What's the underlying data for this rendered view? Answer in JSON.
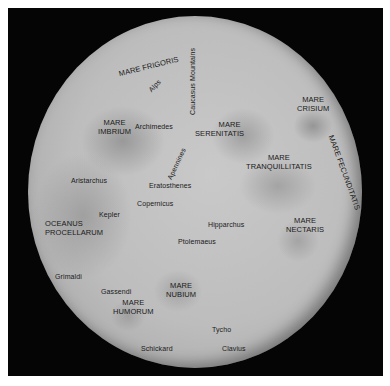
{
  "map": {
    "subject": "Moon near side",
    "colors": {
      "frame": "#050505",
      "moon_surface": "#c0c0c0",
      "label_text": "#1a1a1a",
      "page_background": "#ffffff"
    }
  },
  "labels": {
    "mare_frigoris": "MARE FRIGORIS",
    "alps": "Alps",
    "caucasus_mountains": "Caucasus Mountains",
    "mare_imbrium_1": "MARE",
    "mare_imbrium_2": "IMBRIUM",
    "archimedes": "Archimedes",
    "mare_serenitatis_1": "MARE",
    "mare_serenitatis_2": "SERENITATIS",
    "mare_crisium_1": "MARE",
    "mare_crisium_2": "CRISIUM",
    "apennines": "Apennines",
    "mare_tranquillitatis_1": "MARE",
    "mare_tranquillitatis_2": "TRANQUILLITATIS",
    "mare_fecunditatis": "MARE FECUNDITATIS",
    "aristarchus": "Aristarchus",
    "eratosthenes": "Eratosthenes",
    "copernicus": "Copernicus",
    "kepler": "Kepler",
    "oceanus_procellarum_1": "OCEANUS",
    "oceanus_procellarum_2": "PROCELLARUM",
    "hipparchus": "Hipparchus",
    "mare_nectaris_1": "MARE",
    "mare_nectaris_2": "NECTARIS",
    "ptolemaeus": "Ptolemaeus",
    "grimaldi": "Grimaldi",
    "gassendi": "Gassendi",
    "mare_nubium_1": "MARE",
    "mare_nubium_2": "NUBIUM",
    "mare_humorum_1": "MARE",
    "mare_humorum_2": "HUMORUM",
    "tycho": "Tycho",
    "schickard": "Schickard",
    "clavius": "Clavius"
  }
}
